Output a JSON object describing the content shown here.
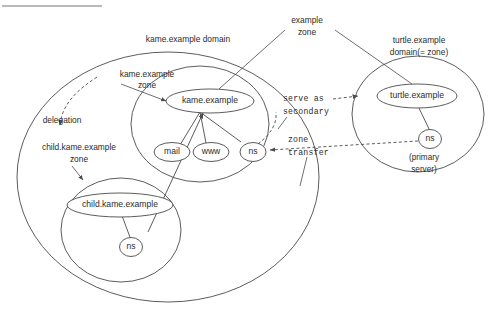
{
  "diagram": {
    "title_rule_present": true,
    "type": "dns-zone-domain-diagram",
    "domains": {
      "kame": {
        "label_line1": "kame.example domain",
        "zone_label_line1": "kame.example",
        "zone_label_line2": "zone",
        "apex": "kame.example",
        "children": [
          "mail",
          "www",
          "ns"
        ],
        "delegation_label": "delegation",
        "child_zone_label_line1": "child.kame.example",
        "child_zone_label_line2": "zone",
        "child_apex": "child.kame.example",
        "child_ns": "ns"
      },
      "turtle": {
        "label_line1": "turtle.example",
        "label_line2": "domain(= zone)",
        "apex": "turtle.example",
        "ns": "ns",
        "ns_note_line1": "(primary",
        "ns_note_line2": "server)"
      }
    },
    "parent_zone": {
      "label_line1": "example",
      "label_line2": "zone"
    },
    "relations": {
      "serve_as_secondary_line1": "serve as",
      "serve_as_secondary_line2": "secondary",
      "zone_transfer_line1": "zone",
      "zone_transfer_line2": "transfer"
    },
    "colors": {
      "stroke": "#4a4a4a",
      "text": "#2b2b2b",
      "background": "#ffffff",
      "rule": "#777777"
    }
  }
}
